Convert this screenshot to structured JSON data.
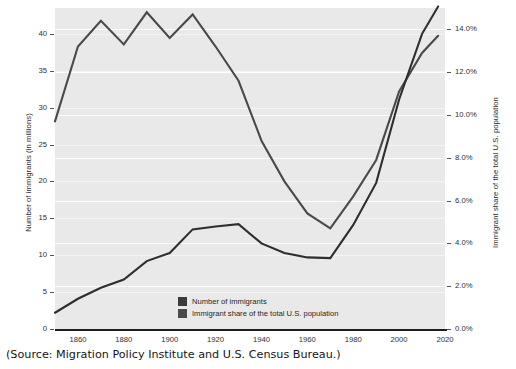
{
  "source_note": "(Source: Migration Policy Institute and U.S. Census Bureau.)",
  "legend": {
    "items": [
      {
        "label": "Number of immigrants",
        "color": "#3a3a3a"
      },
      {
        "label": "Immigrant share of the total U.S. population",
        "color": "#4a4a4a"
      }
    ]
  },
  "colors": {
    "plot_background": "#e9e9e9",
    "gridline": "#fdfdfd",
    "axis": "#1d1d1d",
    "series_count": "#2e2e2e",
    "series_share": "#4a4a4a",
    "text": "#1a1a1a"
  },
  "chart_data": {
    "type": "line",
    "title": "",
    "xlabel": "",
    "ylabel": "Number of immigrants (in millions)",
    "y2label": "Immigrant share of the total U.S. population",
    "grid": true,
    "legend_position": "inside-bottom-center",
    "xlim": [
      1850,
      2020
    ],
    "xticks": [
      1860,
      1880,
      1900,
      1920,
      1940,
      1960,
      1980,
      2000,
      2020
    ],
    "xticklabels": [
      "1860",
      "1880",
      "1900",
      "1920",
      "1940",
      "1960",
      "1980",
      "2000",
      "2020"
    ],
    "ylim": [
      0,
      43.5
    ],
    "yticks": [
      0,
      5,
      10,
      15,
      20,
      25,
      30,
      35,
      40
    ],
    "yticklabels": [
      "0",
      "5",
      "10",
      "15",
      "20",
      "25",
      "30",
      "35",
      "40"
    ],
    "y2lim": [
      0.0,
      15.0
    ],
    "y2ticks": [
      0.0,
      2.0,
      4.0,
      6.0,
      8.0,
      10.0,
      12.0,
      14.0
    ],
    "y2ticklabels": [
      "0.0%",
      "2.0%",
      "4.0%",
      "6.0%",
      "8.0%",
      "10.0%",
      "12.0%",
      "14.0%"
    ],
    "x": [
      1850,
      1860,
      1870,
      1880,
      1890,
      1900,
      1910,
      1920,
      1930,
      1940,
      1950,
      1960,
      1970,
      1980,
      1990,
      2000,
      2010,
      2017
    ],
    "series": [
      {
        "name": "Number of immigrants",
        "axis": "left",
        "units": "millions",
        "color": "#2e2e2e",
        "values": [
          2.2,
          4.1,
          5.6,
          6.7,
          9.2,
          10.3,
          13.5,
          13.9,
          14.2,
          11.6,
          10.3,
          9.7,
          9.6,
          14.1,
          19.8,
          31.1,
          40.0,
          43.7
        ]
      },
      {
        "name": "Immigrant share of the total U.S. population",
        "axis": "right",
        "units": "percent",
        "color": "#4a4a4a",
        "values": [
          9.7,
          13.2,
          14.4,
          13.3,
          14.8,
          13.6,
          14.7,
          13.2,
          11.6,
          8.8,
          6.9,
          5.4,
          4.7,
          6.2,
          7.9,
          11.1,
          12.9,
          13.7
        ]
      }
    ]
  }
}
